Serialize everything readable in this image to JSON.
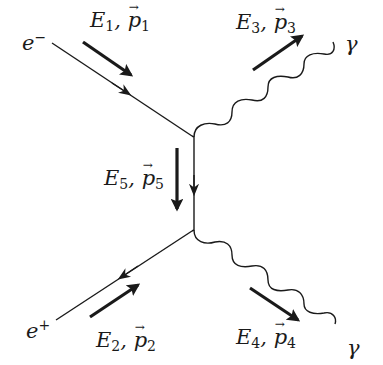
{
  "diagram": {
    "type": "feynman-diagram",
    "process": "electron-positron annihilation into two photons",
    "particles": {
      "electron": {
        "name": "e",
        "charge": "−"
      },
      "positron": {
        "name": "e",
        "charge": "+"
      },
      "photon_top": {
        "name": "γ"
      },
      "photon_bottom": {
        "name": "γ"
      }
    },
    "momenta": [
      {
        "energy": "E",
        "index": "1",
        "momentum": "p",
        "sep": ", "
      },
      {
        "energy": "E",
        "index": "2",
        "momentum": "p",
        "sep": ", "
      },
      {
        "energy": "E",
        "index": "3",
        "momentum": "p",
        "sep": ", "
      },
      {
        "energy": "E",
        "index": "4",
        "momentum": "p",
        "sep": ", "
      },
      {
        "energy": "E",
        "index": "5",
        "momentum": "p",
        "sep": ", "
      }
    ],
    "colors": {
      "line": "#1a1a1a",
      "background": "#ffffff"
    }
  }
}
